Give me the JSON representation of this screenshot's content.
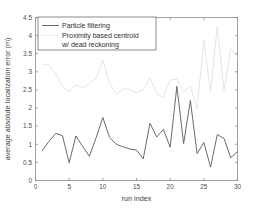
{
  "chart_data": {
    "type": "line",
    "title": "",
    "xlabel": "run index",
    "ylabel": "average absolute localization error (m)",
    "xlim": [
      0,
      30
    ],
    "ylim": [
      0,
      4.5
    ],
    "xticks": [
      "0",
      "5",
      "10",
      "15",
      "20",
      "25",
      "30"
    ],
    "xtick_values": [
      0,
      5,
      10,
      15,
      20,
      25,
      30
    ],
    "yticks": [
      "0",
      "0.5",
      "1",
      "1.5",
      "2",
      "2.5",
      "3",
      "3.5",
      "4",
      "4.5"
    ],
    "ytick_values": [
      0,
      0.5,
      1,
      1.5,
      2,
      2.5,
      3,
      3.5,
      4,
      4.5
    ],
    "grid": false,
    "legend_position": "top-left",
    "x": [
      1,
      2,
      3,
      4,
      5,
      6,
      7,
      8,
      9,
      10,
      11,
      12,
      13,
      14,
      15,
      16,
      17,
      18,
      19,
      20,
      21,
      22,
      23,
      24,
      25,
      26,
      27,
      28,
      29,
      30
    ],
    "series": [
      {
        "name": "Particle filtering",
        "color": "#5a5a5a",
        "style": "solid",
        "values": [
          0.82,
          1.08,
          1.3,
          1.24,
          0.49,
          1.23,
          0.94,
          0.67,
          1.18,
          1.74,
          1.19,
          1.0,
          0.93,
          0.87,
          0.84,
          0.6,
          1.58,
          1.2,
          1.41,
          0.92,
          2.6,
          1.02,
          2.21,
          0.74,
          1.05,
          0.37,
          1.27,
          1.16,
          0.63,
          0.8
        ]
      },
      {
        "name": "Proximity based centroid w/ dead reckoning",
        "color": "#e2e2e2",
        "style": "solid",
        "values": [
          3.21,
          3.18,
          2.96,
          2.6,
          2.45,
          2.64,
          2.56,
          2.67,
          2.82,
          3.32,
          2.7,
          2.38,
          2.53,
          2.52,
          2.42,
          2.5,
          2.83,
          2.4,
          2.3,
          2.77,
          2.8,
          2.44,
          2.62,
          1.97,
          3.88,
          2.44,
          4.25,
          2.49,
          3.63,
          3.42
        ]
      }
    ]
  },
  "legend": {
    "entries": [
      {
        "label": "Particle filtering",
        "color": "#5a5a5a"
      },
      {
        "label": "Proximity based centroid",
        "color": "#e2e2e2"
      },
      {
        "label": "w/ dead reckoning",
        "color": "#e2e2e2"
      }
    ]
  }
}
